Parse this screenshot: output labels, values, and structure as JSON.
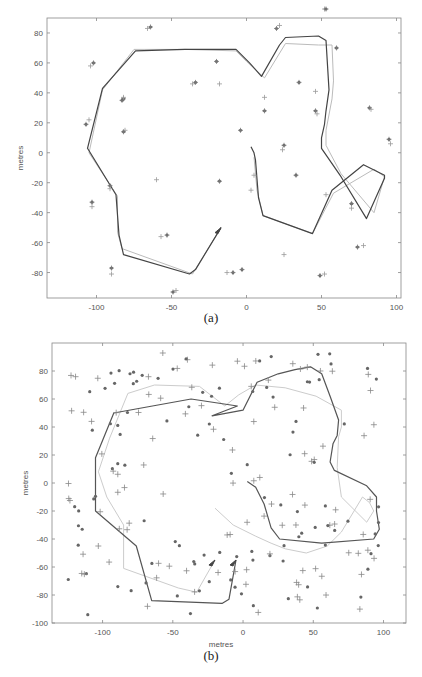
{
  "chart_data": [
    {
      "id": "a",
      "type": "line",
      "caption": "(a)",
      "title": "",
      "xlabel": "metres",
      "ylabel": "metres",
      "xlim": [
        -133,
        103
      ],
      "ylim": [
        -97,
        90
      ],
      "xticks": [
        -100,
        -50,
        0,
        50,
        100
      ],
      "yticks": [
        -80,
        -60,
        -40,
        -20,
        0,
        20,
        40,
        60,
        80
      ],
      "grid": false,
      "legend": null,
      "series": [
        {
          "name": "estimated path",
          "color": "#444444",
          "width": 1.2,
          "points": [
            [
              -17,
              -50
            ],
            [
              -34,
              -78
            ],
            [
              -38,
              -81
            ],
            [
              -82,
              -68
            ],
            [
              -85,
              -55
            ],
            [
              -87,
              -28
            ],
            [
              -106,
              3
            ],
            [
              -96,
              43
            ],
            [
              -74,
              68
            ],
            [
              -41,
              69
            ],
            [
              -7,
              69
            ],
            [
              2,
              60
            ],
            [
              10,
              51
            ],
            [
              22,
              72
            ],
            [
              26,
              77
            ],
            [
              48,
              78
            ],
            [
              53,
              75
            ],
            [
              55,
              42
            ],
            [
              53,
              28
            ],
            [
              52,
              19
            ],
            [
              50,
              10
            ],
            [
              50,
              3
            ],
            [
              63,
              -16
            ],
            [
              80,
              -44
            ],
            [
              92,
              -17
            ],
            [
              92,
              -15
            ],
            [
              78,
              -8
            ],
            [
              57,
              -25
            ],
            [
              44,
              -54
            ],
            [
              11,
              -42
            ],
            [
              8,
              -30
            ],
            [
              6,
              -5
            ],
            [
              5,
              0
            ],
            [
              3,
              4
            ]
          ]
        },
        {
          "name": "true path",
          "color": "#bbbbbb",
          "width": 1.0,
          "points": [
            [
              -17,
              -50
            ],
            [
              -36,
              -81
            ],
            [
              -83,
              -64
            ],
            [
              -86,
              -53
            ],
            [
              -86,
              -29
            ],
            [
              -105,
              0
            ],
            [
              -96,
              42
            ],
            [
              -75,
              69
            ],
            [
              -41,
              69
            ],
            [
              -7,
              68
            ],
            [
              0,
              61
            ],
            [
              12,
              50
            ],
            [
              26,
              73
            ],
            [
              48,
              72
            ],
            [
              57,
              72
            ],
            [
              58,
              48
            ],
            [
              57,
              36
            ],
            [
              53,
              15
            ],
            [
              53,
              5
            ],
            [
              63,
              -14
            ],
            [
              85,
              -40
            ],
            [
              92,
              -16
            ],
            [
              85,
              -11
            ],
            [
              58,
              -27
            ],
            [
              44,
              -54
            ],
            [
              11,
              -42
            ],
            [
              7,
              -25
            ],
            [
              5,
              -3
            ]
          ]
        }
      ],
      "landmarks_true": [
        [
          -107,
          19
        ],
        [
          -105,
          22
        ],
        [
          -53,
          -55
        ],
        [
          -57,
          -56
        ],
        [
          -18,
          -19
        ],
        [
          3,
          -25
        ],
        [
          -3,
          -78
        ],
        [
          25,
          -68
        ],
        [
          49,
          -82
        ],
        [
          52,
          -81
        ],
        [
          74,
          -63
        ],
        [
          78,
          -62
        ],
        [
          -20,
          61
        ],
        [
          -36,
          46
        ],
        [
          -34,
          47
        ],
        [
          -60,
          -18
        ],
        [
          -90,
          -77
        ],
        [
          -90,
          -81
        ],
        [
          -103,
          -33
        ],
        [
          -103,
          -36
        ],
        [
          -91,
          -22
        ],
        [
          -91,
          -24
        ],
        [
          -82,
          36
        ],
        [
          -82,
          37
        ],
        [
          -83,
          35
        ],
        [
          -47,
          -92
        ],
        [
          -49,
          -93
        ],
        [
          -81,
          15
        ],
        [
          -82,
          14
        ],
        [
          12,
          37
        ],
        [
          12,
          28
        ],
        [
          24,
          2
        ],
        [
          35,
          47
        ],
        [
          46,
          41
        ],
        [
          46,
          28
        ],
        [
          47,
          26
        ],
        [
          25,
          5
        ],
        [
          53,
          -28
        ],
        [
          70,
          -34
        ],
        [
          70,
          -37
        ],
        [
          60,
          70
        ],
        [
          -18,
          46
        ],
        [
          82,
          30
        ],
        [
          83,
          29
        ],
        [
          95,
          9
        ],
        [
          96,
          6
        ],
        [
          -4,
          15
        ],
        [
          -13,
          -80
        ],
        [
          -9,
          -80
        ],
        [
          22,
          85
        ],
        [
          20,
          83
        ],
        [
          52,
          96
        ],
        [
          53,
          96
        ],
        [
          -66,
          83
        ],
        [
          -64,
          84
        ],
        [
          -104,
          58
        ],
        [
          -102,
          60
        ],
        [
          5,
          -15
        ],
        [
          33,
          -15
        ]
      ],
      "start_arrow": {
        "x": -17,
        "y": -50
      }
    },
    {
      "id": "b",
      "type": "line",
      "caption": "(b)",
      "title": "",
      "xlabel": "metres",
      "ylabel": "metres",
      "xlim": [
        -136,
        116
      ],
      "ylim": [
        -100,
        100
      ],
      "xticks": [
        -100,
        -50,
        0,
        50,
        100
      ],
      "yticks": [
        -100,
        -80,
        -60,
        -40,
        -20,
        0,
        20,
        40,
        60,
        80
      ],
      "grid": false,
      "legend": null,
      "series": [
        {
          "name": "estimated path",
          "color": "#555555",
          "width": 1.2,
          "points": [
            [
              -5,
              -55
            ],
            [
              -10,
              -83
            ],
            [
              -15,
              -86
            ],
            [
              -65,
              -84
            ],
            [
              -76,
              -45
            ],
            [
              -105,
              -20
            ],
            [
              -105,
              18
            ],
            [
              -92,
              50
            ],
            [
              -37,
              60
            ],
            [
              -4,
              55
            ],
            [
              -22,
              48
            ],
            [
              0,
              52
            ],
            [
              10,
              72
            ],
            [
              25,
              78
            ],
            [
              37,
              81
            ],
            [
              48,
              83
            ],
            [
              56,
              78
            ],
            [
              62,
              62
            ],
            [
              68,
              45
            ],
            [
              67,
              34
            ],
            [
              64,
              28
            ],
            [
              62,
              15
            ],
            [
              65,
              9
            ],
            [
              88,
              -2
            ],
            [
              95,
              -10
            ],
            [
              95,
              -20
            ],
            [
              97,
              -33
            ],
            [
              93,
              -40
            ],
            [
              56,
              -43
            ],
            [
              26,
              -40
            ],
            [
              20,
              -32
            ],
            [
              15,
              -15
            ],
            [
              9,
              -3
            ],
            [
              3,
              1
            ]
          ]
        },
        {
          "name": "true path",
          "color": "#cccccc",
          "width": 1.0,
          "points": [
            [
              -20,
              -55
            ],
            [
              -33,
              -78
            ],
            [
              -46,
              -75
            ],
            [
              -85,
              -61
            ],
            [
              -85,
              -30
            ],
            [
              -97,
              -10
            ],
            [
              -103,
              8
            ],
            [
              -95,
              32
            ],
            [
              -82,
              64
            ],
            [
              -63,
              70
            ],
            [
              -31,
              69
            ],
            [
              -13,
              55
            ],
            [
              -3,
              63
            ],
            [
              9,
              70
            ],
            [
              30,
              68
            ],
            [
              52,
              62
            ],
            [
              70,
              52
            ],
            [
              70,
              40
            ],
            [
              68,
              33
            ],
            [
              67,
              11
            ],
            [
              70,
              -10
            ],
            [
              88,
              -28
            ],
            [
              93,
              -20
            ],
            [
              90,
              -14
            ],
            [
              85,
              -10
            ],
            [
              70,
              -35
            ],
            [
              60,
              -45
            ],
            [
              45,
              -50
            ],
            [
              30,
              -47
            ],
            [
              20,
              -43
            ],
            [
              9,
              -38
            ],
            [
              -7,
              -30
            ],
            [
              -20,
              -18
            ]
          ]
        }
      ],
      "landmarks_count_approx": 230,
      "start_arrows": [
        {
          "x": -20,
          "y": -55
        },
        {
          "x": -5,
          "y": -55
        }
      ]
    }
  ]
}
